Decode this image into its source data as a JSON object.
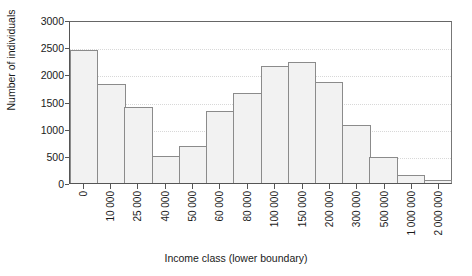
{
  "chart_data": {
    "type": "bar",
    "title": "",
    "xlabel": "Income class (lower boundary)",
    "ylabel": "Number of individuals",
    "categories": [
      "0",
      "10 000",
      "25 000",
      "40 000",
      "50 000",
      "60 000",
      "80 000",
      "100 000",
      "150 000",
      "200 000",
      "300 000",
      "500 000",
      "1 000 000",
      "2 000 000"
    ],
    "bars": [
      {
        "label": "0",
        "value": 2440
      },
      {
        "label": "10 000",
        "value": 1820
      },
      {
        "label": "25 000",
        "value": 1390
      },
      {
        "label": "40 000",
        "value": 490
      },
      {
        "label": "50 000",
        "value": 680
      },
      {
        "label": "60 000",
        "value": 1320
      },
      {
        "label": "80 000",
        "value": 1650
      },
      {
        "label": "100 000",
        "value": 2160
      },
      {
        "label": "150 000",
        "value": 2220
      },
      {
        "label": "200 000",
        "value": 1850
      },
      {
        "label": "300 000",
        "value": 1060
      },
      {
        "label": "500 000",
        "value": 470
      },
      {
        "label": "1 000 000",
        "value": 150
      },
      {
        "label": "2 000 000",
        "value": 60
      }
    ],
    "values": [
      2440,
      1820,
      1390,
      490,
      680,
      1320,
      1650,
      2160,
      2220,
      1850,
      1060,
      470,
      150,
      60
    ],
    "yticks": [
      "0",
      "500",
      "1000",
      "1500",
      "2000",
      "2500",
      "3000"
    ],
    "ytick_values": [
      0,
      500,
      1000,
      1500,
      2000,
      2500,
      3000
    ],
    "ylim": [
      0,
      3000
    ],
    "grid": true,
    "legend": "none",
    "bar_fill": "#f2f2f2",
    "bar_border": "#8b8b8b",
    "grid_color": "#d8d8d8",
    "axis_color": "#555555"
  }
}
